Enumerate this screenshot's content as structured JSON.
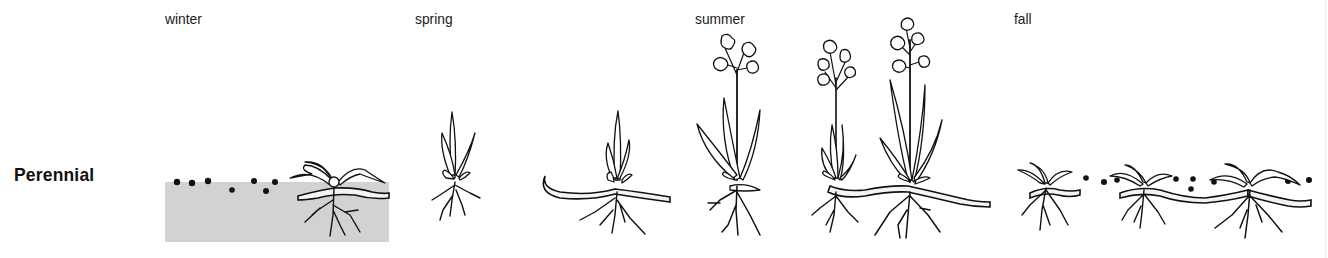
{
  "diagram": {
    "row_label": "Perennial",
    "colors": {
      "ground": "#d2d2d2",
      "ink": "#111111",
      "background": "#ffffff"
    },
    "seasons": [
      {
        "label": "winter",
        "description": "seeds on soil surface; dormant plant with dead leaves and rhizome"
      },
      {
        "label": "spring",
        "description": "seedling shoot; new shoot emerging from rhizome"
      },
      {
        "label": "summer",
        "description": "flowering plants connected by spreading rhizome"
      },
      {
        "label": "fall",
        "description": "plants die back, seeds dropped, rhizomes spread"
      }
    ]
  }
}
